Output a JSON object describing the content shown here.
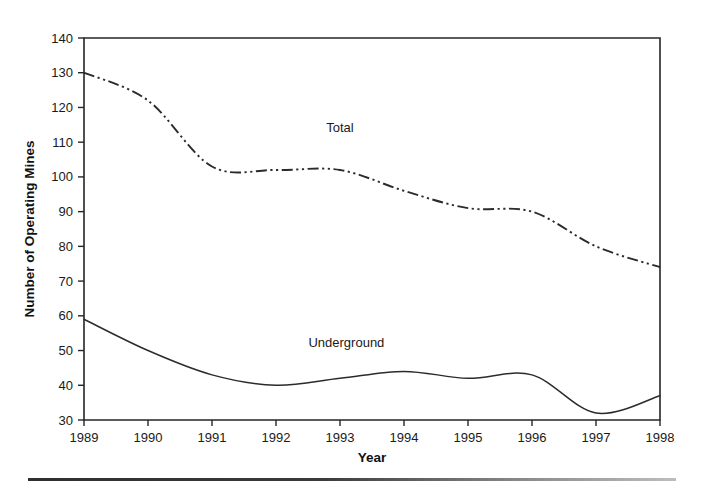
{
  "chart_data": {
    "type": "line",
    "title": "",
    "xlabel": "Year",
    "ylabel": "Number of Operating Mines",
    "xlim": [
      1989,
      1998
    ],
    "ylim": [
      30,
      140
    ],
    "grid": false,
    "legend_position": "inline-annotation",
    "x": [
      1989,
      1990,
      1991,
      1992,
      1993,
      1994,
      1995,
      1996,
      1997,
      1998
    ],
    "xticklabels": [
      "1989",
      "1990",
      "1991",
      "1992",
      "1993",
      "1994",
      "1995",
      "1996",
      "1997",
      "1998"
    ],
    "yticks": [
      30,
      40,
      50,
      60,
      70,
      80,
      90,
      100,
      110,
      120,
      130,
      140
    ],
    "yticklabels": [
      "30",
      "40",
      "50",
      "60",
      "70",
      "80",
      "90",
      "100",
      "110",
      "120",
      "130",
      "140"
    ],
    "series": [
      {
        "name": "Total",
        "linestyle": "dash-dot-dot",
        "color": "#2b2b2b",
        "label_x": 1993.0,
        "label_y": 113,
        "values": [
          130,
          122,
          103,
          102,
          102,
          96,
          91,
          90,
          80,
          74
        ]
      },
      {
        "name": "Underground",
        "linestyle": "solid",
        "color": "#2b2b2b",
        "label_x": 1993.1,
        "label_y": 51,
        "values": [
          59,
          50,
          43,
          40,
          42,
          44,
          42,
          43,
          32,
          37
        ]
      }
    ],
    "annotations": [
      {
        "text": "Total",
        "x": 1993.0,
        "y": 113
      },
      {
        "text": "Underground",
        "x": 1993.1,
        "y": 51
      }
    ]
  },
  "axis": {
    "x_title": "Year",
    "y_title": "Number of Operating Mines"
  }
}
